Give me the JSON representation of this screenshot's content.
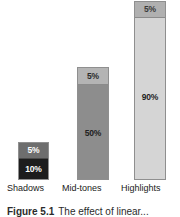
{
  "figure": {
    "caption_label": "Figure 5.1",
    "caption_text": "The effect of linear...",
    "background_color": "#ffffff"
  },
  "chart_data": {
    "type": "bar",
    "stacked": true,
    "title": "",
    "xlabel": "",
    "ylabel": "",
    "grid": false,
    "legend": "none",
    "ylim": [
      0,
      95
    ],
    "categories": [
      "Shadows",
      "Mid-tones",
      "Highlights"
    ],
    "series": [
      {
        "name": "main",
        "values": [
          10,
          50,
          90
        ],
        "labels": [
          "10%",
          "50%",
          "90%"
        ],
        "colors": [
          "#1d1d1d",
          "#8d8d8d",
          "#d5d5d5"
        ],
        "label_colors": [
          "#ffffff",
          "#212121",
          "#1f1f1f"
        ]
      },
      {
        "name": "cap",
        "values": [
          5,
          5,
          5
        ],
        "labels": [
          "5%",
          "5%",
          "5%"
        ],
        "colors": [
          "#6e6e6e",
          "#b4b4b4",
          "#b0b0b0"
        ],
        "label_colors": [
          "#ffffff",
          "#2a2a2a",
          "#3a3a3a"
        ]
      }
    ],
    "bars": [
      {
        "category": "Shadows",
        "cap_label": "5%",
        "cap_value": 5,
        "main_label": "10%",
        "main_value": 10,
        "cap_color": "#6e6e6e",
        "main_color": "#1d1d1d"
      },
      {
        "category": "Mid-tones",
        "cap_label": "5%",
        "cap_value": 5,
        "main_label": "50%",
        "main_value": 50,
        "cap_color": "#b4b4b4",
        "main_color": "#8d8d8d"
      },
      {
        "category": "Highlights",
        "cap_label": "5%",
        "cap_value": 5,
        "main_label": "90%",
        "main_value": 90,
        "cap_color": "#b0b0b0",
        "main_color": "#d5d5d5"
      }
    ],
    "axis_labels": [
      "Shadows",
      "Mid-tones",
      "Highlights"
    ],
    "border_color": "#8f8f8f"
  }
}
